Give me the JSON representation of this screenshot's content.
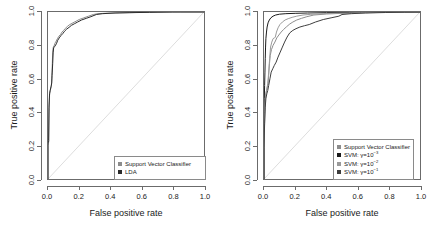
{
  "figure": {
    "background": "#ffffff",
    "diagonal_color": "#dddddd"
  },
  "axes": {
    "xlabel": "False positive rate",
    "ylabel": "True positive rate",
    "xticks": [
      "0.0",
      "0.2",
      "0.4",
      "0.6",
      "0.8",
      "1.0"
    ],
    "yticks": [
      "0.0",
      "0.2",
      "0.4",
      "0.6",
      "0.8",
      "1.0"
    ],
    "xlim": [
      0,
      1
    ],
    "ylim": [
      0,
      1
    ],
    "grid": false,
    "frame_color": "#6b6b6b"
  },
  "panels": [
    {
      "id": "left",
      "legend_position": "bottom-right",
      "legend": [
        {
          "label": "Support Vector Classifier",
          "color": "#8c8c8c"
        },
        {
          "label": "LDA",
          "color": "#2b2b2b"
        }
      ]
    },
    {
      "id": "right",
      "legend_position": "bottom-right",
      "legend": [
        {
          "label": "Support Vector Classifier",
          "color": "#8c8c8c"
        },
        {
          "label": "SVM: ",
          "gamma_prefix": "γ=10",
          "exponent": "−3",
          "color": "#1a1a1a"
        },
        {
          "label": "SVM: ",
          "gamma_prefix": "γ=10",
          "exponent": "−2",
          "color": "#9a9a9a"
        },
        {
          "label": "SVM: ",
          "gamma_prefix": "γ=10",
          "exponent": "−1",
          "color": "#3d3d3d"
        }
      ]
    }
  ],
  "chart_data": [
    {
      "type": "line",
      "panel": "left",
      "title": "",
      "xlabel": "False positive rate",
      "ylabel": "True positive rate",
      "xlim": [
        0,
        1
      ],
      "ylim": [
        0,
        1
      ],
      "grid": false,
      "legend_position": "bottom-right",
      "reference_line": {
        "name": "chance diagonal",
        "from": [
          0,
          0
        ],
        "to": [
          1,
          1
        ],
        "color": "#dddddd"
      },
      "series": [
        {
          "name": "Support Vector Classifier",
          "color": "#8c8c8c",
          "points": [
            [
              0.0,
              0.0
            ],
            [
              0.0,
              0.2
            ],
            [
              0.005,
              0.225
            ],
            [
              0.005,
              0.24
            ],
            [
              0.008,
              0.42
            ],
            [
              0.01,
              0.5
            ],
            [
              0.012,
              0.52
            ],
            [
              0.018,
              0.545
            ],
            [
              0.022,
              0.56
            ],
            [
              0.024,
              0.6
            ],
            [
              0.026,
              0.64
            ],
            [
              0.028,
              0.7
            ],
            [
              0.03,
              0.76
            ],
            [
              0.034,
              0.79
            ],
            [
              0.04,
              0.8
            ],
            [
              0.046,
              0.815
            ],
            [
              0.052,
              0.825
            ],
            [
              0.06,
              0.84
            ],
            [
              0.07,
              0.855
            ],
            [
              0.08,
              0.865
            ],
            [
              0.09,
              0.88
            ],
            [
              0.1,
              0.89
            ],
            [
              0.11,
              0.9
            ],
            [
              0.125,
              0.915
            ],
            [
              0.14,
              0.925
            ],
            [
              0.16,
              0.935
            ],
            [
              0.18,
              0.945
            ],
            [
              0.2,
              0.955
            ],
            [
              0.23,
              0.965
            ],
            [
              0.26,
              0.975
            ],
            [
              0.29,
              0.985
            ],
            [
              0.32,
              0.99
            ],
            [
              0.38,
              0.993
            ],
            [
              0.46,
              0.995
            ],
            [
              0.56,
              0.997
            ],
            [
              0.7,
              0.999
            ],
            [
              0.85,
              1.0
            ],
            [
              1.0,
              1.0
            ]
          ]
        },
        {
          "name": "LDA",
          "color": "#2b2b2b",
          "points": [
            [
              0.0,
              0.0
            ],
            [
              0.0,
              0.215
            ],
            [
              0.004,
              0.23
            ],
            [
              0.006,
              0.43
            ],
            [
              0.01,
              0.51
            ],
            [
              0.014,
              0.53
            ],
            [
              0.02,
              0.555
            ],
            [
              0.024,
              0.575
            ],
            [
              0.026,
              0.62
            ],
            [
              0.03,
              0.69
            ],
            [
              0.033,
              0.755
            ],
            [
              0.036,
              0.785
            ],
            [
              0.044,
              0.795
            ],
            [
              0.054,
              0.81
            ],
            [
              0.062,
              0.83
            ],
            [
              0.072,
              0.845
            ],
            [
              0.084,
              0.86
            ],
            [
              0.096,
              0.872
            ],
            [
              0.106,
              0.885
            ],
            [
              0.12,
              0.898
            ],
            [
              0.135,
              0.908
            ],
            [
              0.15,
              0.92
            ],
            [
              0.17,
              0.93
            ],
            [
              0.19,
              0.94
            ],
            [
              0.215,
              0.952
            ],
            [
              0.245,
              0.962
            ],
            [
              0.275,
              0.972
            ],
            [
              0.31,
              0.985
            ],
            [
              0.35,
              0.99
            ],
            [
              0.43,
              0.994
            ],
            [
              0.52,
              0.996
            ],
            [
              0.65,
              0.998
            ],
            [
              0.8,
              1.0
            ],
            [
              1.0,
              1.0
            ]
          ]
        }
      ]
    },
    {
      "type": "line",
      "panel": "right",
      "title": "",
      "xlabel": "False positive rate",
      "ylabel": "True positive rate",
      "xlim": [
        0,
        1
      ],
      "ylim": [
        0,
        1
      ],
      "grid": false,
      "legend_position": "bottom-right",
      "reference_line": {
        "name": "chance diagonal",
        "from": [
          0,
          0
        ],
        "to": [
          1,
          1
        ],
        "color": "#dddddd"
      },
      "series": [
        {
          "name": "Support Vector Classifier",
          "color": "#8c8c8c",
          "points": [
            [
              0.0,
              0.0
            ],
            [
              0.0,
              0.2
            ],
            [
              0.006,
              0.42
            ],
            [
              0.01,
              0.5
            ],
            [
              0.014,
              0.52
            ],
            [
              0.02,
              0.545
            ],
            [
              0.026,
              0.57
            ],
            [
              0.03,
              0.62
            ],
            [
              0.035,
              0.69
            ],
            [
              0.04,
              0.74
            ],
            [
              0.048,
              0.775
            ],
            [
              0.058,
              0.8
            ],
            [
              0.07,
              0.82
            ],
            [
              0.082,
              0.845
            ],
            [
              0.095,
              0.862
            ],
            [
              0.11,
              0.88
            ],
            [
              0.125,
              0.895
            ],
            [
              0.145,
              0.912
            ],
            [
              0.165,
              0.928
            ],
            [
              0.185,
              0.94
            ],
            [
              0.21,
              0.952
            ],
            [
              0.24,
              0.962
            ],
            [
              0.275,
              0.972
            ],
            [
              0.32,
              0.982
            ],
            [
              0.4,
              0.988
            ],
            [
              0.5,
              0.992
            ],
            [
              0.62,
              0.995
            ],
            [
              0.78,
              0.998
            ],
            [
              0.9,
              1.0
            ],
            [
              1.0,
              1.0
            ]
          ]
        },
        {
          "name": "SVM: gamma=10^-3",
          "color": "#1a1a1a",
          "points": [
            [
              0.0,
              0.0
            ],
            [
              0.0,
              0.3
            ],
            [
              0.002,
              0.48
            ],
            [
              0.004,
              0.56
            ],
            [
              0.006,
              0.64
            ],
            [
              0.008,
              0.72
            ],
            [
              0.01,
              0.79
            ],
            [
              0.012,
              0.84
            ],
            [
              0.016,
              0.88
            ],
            [
              0.02,
              0.91
            ],
            [
              0.026,
              0.935
            ],
            [
              0.034,
              0.952
            ],
            [
              0.044,
              0.965
            ],
            [
              0.058,
              0.975
            ],
            [
              0.075,
              0.982
            ],
            [
              0.1,
              0.987
            ],
            [
              0.14,
              0.99
            ],
            [
              0.2,
              0.992
            ],
            [
              0.28,
              0.994
            ],
            [
              0.4,
              0.996
            ],
            [
              0.55,
              0.997
            ],
            [
              0.72,
              0.999
            ],
            [
              0.88,
              1.0
            ],
            [
              1.0,
              1.0
            ]
          ]
        },
        {
          "name": "SVM: gamma=10^-2",
          "color": "#9a9a9a",
          "points": [
            [
              0.0,
              0.0
            ],
            [
              0.0,
              0.2
            ],
            [
              0.004,
              0.4
            ],
            [
              0.008,
              0.48
            ],
            [
              0.012,
              0.51
            ],
            [
              0.018,
              0.54
            ],
            [
              0.024,
              0.57
            ],
            [
              0.03,
              0.64
            ],
            [
              0.036,
              0.72
            ],
            [
              0.042,
              0.79
            ],
            [
              0.05,
              0.82
            ],
            [
              0.058,
              0.84
            ],
            [
              0.066,
              0.845
            ],
            [
              0.072,
              0.848
            ],
            [
              0.08,
              0.88
            ],
            [
              0.09,
              0.905
            ],
            [
              0.102,
              0.925
            ],
            [
              0.118,
              0.94
            ],
            [
              0.135,
              0.952
            ],
            [
              0.155,
              0.96
            ],
            [
              0.18,
              0.968
            ],
            [
              0.21,
              0.975
            ],
            [
              0.25,
              0.982
            ],
            [
              0.3,
              0.986
            ],
            [
              0.38,
              0.99
            ],
            [
              0.48,
              0.993
            ],
            [
              0.62,
              0.996
            ],
            [
              0.8,
              0.999
            ],
            [
              1.0,
              1.0
            ]
          ]
        },
        {
          "name": "SVM: gamma=10^-1",
          "color": "#3d3d3d",
          "points": [
            [
              0.0,
              0.0
            ],
            [
              0.0,
              0.19
            ],
            [
              0.004,
              0.33
            ],
            [
              0.008,
              0.43
            ],
            [
              0.012,
              0.48
            ],
            [
              0.018,
              0.51
            ],
            [
              0.024,
              0.53
            ],
            [
              0.03,
              0.56
            ],
            [
              0.038,
              0.6
            ],
            [
              0.046,
              0.64
            ],
            [
              0.056,
              0.66
            ],
            [
              0.066,
              0.68
            ],
            [
              0.078,
              0.7
            ],
            [
              0.09,
              0.73
            ],
            [
              0.104,
              0.76
            ],
            [
              0.118,
              0.79
            ],
            [
              0.132,
              0.82
            ],
            [
              0.148,
              0.85
            ],
            [
              0.165,
              0.875
            ],
            [
              0.185,
              0.89
            ],
            [
              0.205,
              0.9
            ],
            [
              0.23,
              0.91
            ],
            [
              0.26,
              0.918
            ],
            [
              0.29,
              0.925
            ],
            [
              0.33,
              0.94
            ],
            [
              0.38,
              0.955
            ],
            [
              0.43,
              0.965
            ],
            [
              0.48,
              0.975
            ],
            [
              0.5,
              0.985
            ],
            [
              0.56,
              0.99
            ],
            [
              0.65,
              0.994
            ],
            [
              0.78,
              0.997
            ],
            [
              0.9,
              0.999
            ],
            [
              1.0,
              1.0
            ]
          ]
        }
      ]
    }
  ]
}
